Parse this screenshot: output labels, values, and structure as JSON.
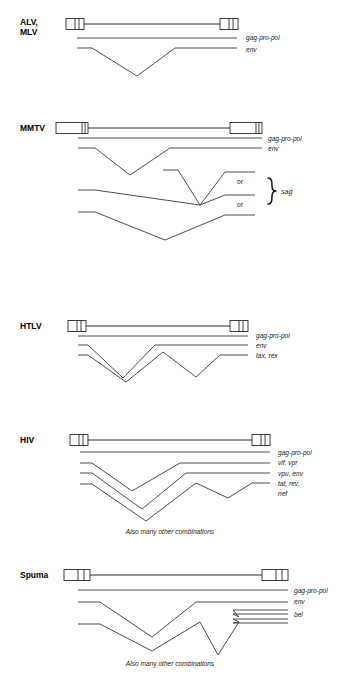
{
  "figure": {
    "title_fragment": "",
    "background": "#ffffff",
    "line_color": "#2b2b2b",
    "text_color": "#1a1a1a",
    "width": 338,
    "height": 681
  },
  "panels": [
    {
      "id": "alv-mlv",
      "name_lines": [
        "ALV,",
        "MLV"
      ],
      "name_text": "ALV, MLV",
      "gene_labels": [
        "gag-pro-pol",
        "env"
      ],
      "note": "",
      "or_labels": [],
      "bracket_label": ""
    },
    {
      "id": "mmtv",
      "name_lines": [
        "MMTV"
      ],
      "name_text": "MMTV",
      "gene_labels": [
        "gag-pro-pol",
        "env"
      ],
      "note": "",
      "or_labels": [
        "or",
        "or"
      ],
      "bracket_label": "sag"
    },
    {
      "id": "htlv",
      "name_lines": [
        "HTLV"
      ],
      "name_text": "HTLV",
      "gene_labels": [
        "gag-pro-pol",
        "env",
        "tax, rex"
      ],
      "note": "",
      "or_labels": [],
      "bracket_label": ""
    },
    {
      "id": "hiv",
      "name_lines": [
        "HIV"
      ],
      "name_text": "HIV",
      "gene_labels": [
        "gag-pro-pol",
        "vif, vpr",
        "vpu, env",
        "tat, rev,",
        "nef"
      ],
      "note": "Also many other combinations",
      "or_labels": [],
      "bracket_label": ""
    },
    {
      "id": "spuma",
      "name_lines": [
        "Spuma"
      ],
      "name_text": "Spuma",
      "gene_labels": [
        "gag-pro-pol",
        "env",
        "bel"
      ],
      "note": "Also many other combinations",
      "or_labels": [],
      "bracket_label": ""
    }
  ],
  "labels": {
    "alv_name_1": "ALV,",
    "alv_name_2": "MLV",
    "alv_gag": "gag-pro-pol",
    "alv_env": "env",
    "mmtv_name": "MMTV",
    "mmtv_gag": "gag-pro-pol",
    "mmtv_env": "env",
    "mmtv_or_1": "or",
    "mmtv_or_2": "or",
    "mmtv_sag": "sag",
    "htlv_name": "HTLV",
    "htlv_gag": "gag-pro-pol",
    "htlv_env": "env",
    "htlv_taxrex": "tax, rex",
    "hiv_name": "HIV",
    "hiv_gag": "gag-pro-pol",
    "hiv_vifvpr": "vif, vpr",
    "hiv_vpuenv": "vpu, env",
    "hiv_tatrev": "tat, rev,",
    "hiv_nef": "nef",
    "hiv_note": "Also many other combinations",
    "spuma_name": "Spuma",
    "spuma_gag": "gag-pro-pol",
    "spuma_env": "env",
    "spuma_bel": "bel",
    "spuma_note": "Also many other combinations"
  }
}
